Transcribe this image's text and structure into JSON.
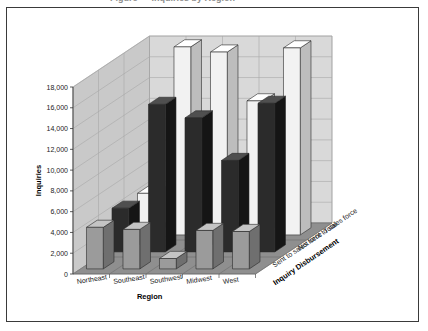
{
  "frame": {
    "border_color": "#3a3a3a",
    "background": "#ffffff"
  },
  "title": "Figure — Inquiries by Region",
  "axis": {
    "y_title": "Inquiries",
    "x_title": "Region",
    "z_title": "Inquiry Disbursement"
  },
  "palette": {
    "wall_back": "#d9d9d9",
    "wall_side": "#c9c9c9",
    "floor": "#8f8f8f",
    "grid": "#a8a8a8",
    "bar_sent_front": "#9b9b9b",
    "bar_sent_side": "#6f6f6f",
    "bar_sent_top": "#c4c4c4",
    "bar_notsent_front": "#2b2b2b",
    "bar_notsent_side": "#151515",
    "bar_notsent_top": "#4f4f4f",
    "bar_total_front": "#f2f2f2",
    "bar_total_side": "#bdbdbd",
    "bar_total_top": "#ffffff"
  },
  "chart_data": {
    "type": "bar",
    "xlabel": "Region",
    "ylabel": "Inquiries",
    "zlabel": "Inquiry Disbursement",
    "ylim": [
      0,
      18000
    ],
    "ytick_step": 2000,
    "yticks": [
      0,
      2000,
      4000,
      6000,
      8000,
      10000,
      12000,
      14000,
      16000,
      18000
    ],
    "ytick_labels": [
      "0",
      "2,000",
      "4,000",
      "6,000",
      "8,000",
      "10,000",
      "12,000",
      "14,000",
      "16,000",
      "18,000"
    ],
    "grid": true,
    "legend": "none",
    "projection": "3d",
    "categories": [
      "Northeast",
      "Southeast",
      "Southwest",
      "Midwest",
      "West"
    ],
    "series": [
      {
        "name": "Sent to sales force",
        "values": [
          4000,
          3800,
          1000,
          3700,
          3600
        ]
      },
      {
        "name": "Not sent to sales force",
        "values": [
          4200,
          14200,
          12900,
          8800,
          14300
        ]
      },
      {
        "name": "Total",
        "values": [
          4000,
          18100,
          17600,
          12900,
          18000
        ]
      }
    ]
  }
}
